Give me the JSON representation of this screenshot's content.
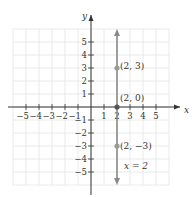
{
  "chart_data": {
    "type": "line",
    "title": "",
    "xlabel": "x",
    "ylabel": "y",
    "xlim": [
      -6,
      6
    ],
    "ylim": [
      -6,
      6
    ],
    "grid": true,
    "x_ticks": [
      -5,
      -4,
      -3,
      -2,
      -1,
      1,
      2,
      3,
      4,
      5
    ],
    "y_ticks": [
      5,
      4,
      3,
      2,
      1,
      -1,
      -2,
      -3,
      -4,
      -5
    ],
    "x_tick_labels": [
      "−5",
      "−4",
      "−3",
      "−2",
      "−1",
      "1",
      "2",
      "3",
      "4",
      "5"
    ],
    "y_tick_labels": [
      "5",
      "4",
      "3",
      "2",
      "1",
      "−1",
      "−2",
      "−3",
      "−4",
      "−5"
    ],
    "series": [
      {
        "name": "x = 2",
        "type": "vertical-line",
        "x": 2,
        "arrows": "both",
        "color": "#8a8a8a"
      }
    ],
    "points": [
      {
        "x": 2,
        "y": 3,
        "label": "(2, 3)",
        "color": "#9a9a9a"
      },
      {
        "x": 2,
        "y": 0,
        "label": "(2, 0)",
        "color": "#555555"
      },
      {
        "x": 2,
        "y": -3,
        "label": "(2, −3)",
        "color": "#9a9a9a"
      }
    ],
    "annotations": [
      {
        "text": "x = 2",
        "x": 2.6,
        "y": -4.6
      }
    ]
  },
  "labels": {
    "x_axis": "x",
    "y_axis": "y",
    "p1": "(2, 3)",
    "p2": "(2, 0)",
    "p3": "(2, −3)",
    "eq": "x = 2"
  },
  "colors": {
    "grid": "#e6e6e6",
    "axis": "#333333",
    "line": "#8a8a8a"
  }
}
